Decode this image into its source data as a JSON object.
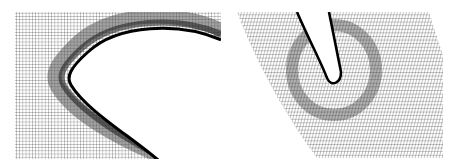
{
  "figure": {
    "panels": [
      {
        "id": "left",
        "description": "Structured mesh around airfoil leading edge",
        "line_color": "#1a1a1a",
        "background": "#ffffff"
      },
      {
        "id": "right",
        "description": "Skewed structured mesh around slot/trailing edge with O-grid refinement",
        "line_color": "#1a1a1a",
        "background": "#ffffff"
      }
    ]
  }
}
